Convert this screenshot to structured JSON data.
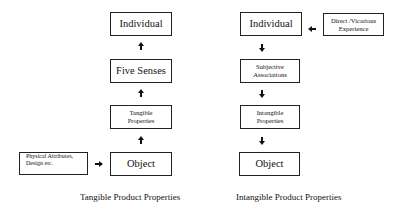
{
  "tangible": {
    "boxes": {
      "individual": "Individual",
      "five_senses": "Five Senses",
      "tangible_properties_1": "Tangible",
      "tangible_properties_2": "Properties",
      "object": "Object",
      "physical_1": "Physical Attributes,",
      "physical_2": "Design etc."
    },
    "caption": "Tangible Product Properties"
  },
  "intangible": {
    "boxes": {
      "individual": "Individual",
      "direct_1": "Direct /Vicarious",
      "direct_2": "Experience",
      "subjective_1": "Subjective",
      "subjective_2": "Associations",
      "intangible_1": "Intangible",
      "intangible_2": "Properties",
      "object": "Object"
    },
    "caption": "Intangible Product Properties"
  }
}
